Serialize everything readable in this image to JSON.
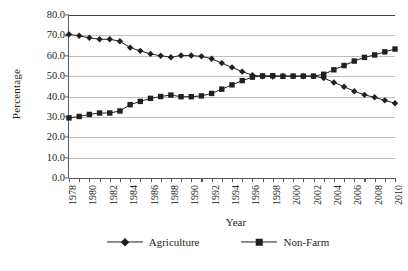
{
  "chart_data": {
    "type": "line",
    "title": "",
    "xlabel": "Year",
    "ylabel": "Percentage",
    "xlim": [
      1978,
      2010
    ],
    "ylim": [
      0.0,
      80.0
    ],
    "ytick_step": 10.0,
    "grid": true,
    "legend_position": "bottom",
    "x": [
      1978,
      1979,
      1980,
      1981,
      1982,
      1983,
      1984,
      1985,
      1986,
      1987,
      1988,
      1989,
      1990,
      1991,
      1992,
      1993,
      1994,
      1995,
      1996,
      1997,
      1998,
      1999,
      2000,
      2001,
      2002,
      2003,
      2004,
      2005,
      2006,
      2007,
      2008,
      2009,
      2010
    ],
    "ytick_labels": [
      "80.0",
      "70.0",
      "60.0",
      "50.0",
      "40.0",
      "30.0",
      "20.0",
      "10.0",
      "0.0"
    ],
    "ytick_values": [
      80.0,
      70.0,
      60.0,
      50.0,
      40.0,
      30.0,
      20.0,
      10.0,
      0.0
    ],
    "xtick_labels": [
      "1978",
      "1980",
      "1982",
      "1984",
      "1986",
      "1988",
      "1990",
      "1992",
      "1994",
      "1996",
      "1998",
      "2000",
      "2002",
      "2004",
      "2006",
      "2008",
      "2010"
    ],
    "xtick_label_values": [
      1978,
      1980,
      1982,
      1984,
      1986,
      1988,
      1990,
      1992,
      1994,
      1996,
      1998,
      2000,
      2002,
      2004,
      2006,
      2008,
      2010
    ],
    "series": [
      {
        "name": "Agriculture",
        "marker": "diamond",
        "color": "#231f20",
        "values": [
          70.5,
          69.8,
          68.8,
          68.1,
          68.1,
          67.1,
          64.0,
          62.4,
          60.9,
          60.0,
          59.3,
          60.1,
          60.1,
          59.7,
          58.5,
          56.4,
          54.3,
          52.2,
          50.5,
          49.9,
          49.8,
          50.1,
          50.0,
          50.0,
          50.0,
          49.1,
          46.9,
          44.8,
          42.6,
          40.8,
          39.6,
          38.1,
          36.7
        ]
      },
      {
        "name": "Non-Farm",
        "marker": "square",
        "color": "#231f20",
        "values": [
          29.5,
          30.2,
          31.2,
          31.9,
          31.9,
          32.9,
          36.0,
          37.6,
          39.1,
          40.0,
          40.7,
          39.9,
          39.9,
          40.3,
          41.5,
          43.6,
          45.7,
          47.8,
          49.5,
          50.1,
          50.2,
          49.9,
          50.0,
          50.0,
          50.0,
          50.9,
          53.1,
          55.2,
          57.4,
          59.2,
          60.4,
          61.9,
          63.3
        ]
      }
    ]
  },
  "legend": {
    "entries": [
      {
        "label": "Agriculture",
        "marker": "diamond"
      },
      {
        "label": "Non-Farm",
        "marker": "square"
      }
    ]
  }
}
